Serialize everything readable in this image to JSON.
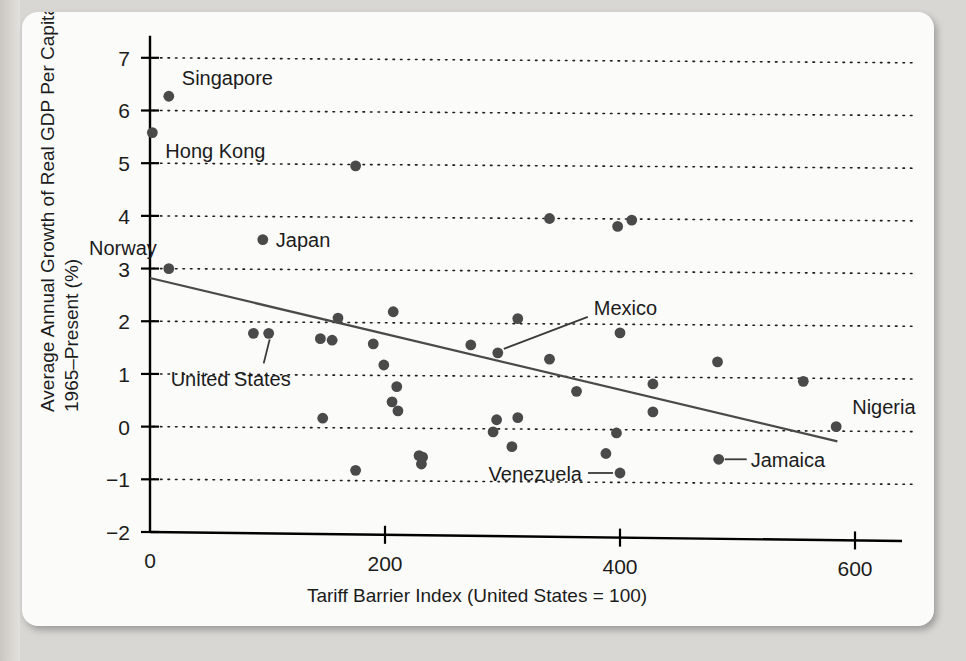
{
  "chart_data": {
    "type": "scatter",
    "title": "",
    "xlabel": "Tariff Barrier Index (United States = 100)",
    "ylabel": "Average Annual Growth of Real GDP Per Capita, 1965–Present (%)",
    "ylabel_line1": "Average Annual Growth of Real GDP Per Capita,",
    "ylabel_line2": "1965–Present (%)",
    "xlim": [
      0,
      640
    ],
    "ylim": [
      -2,
      7.3
    ],
    "xticks": [
      0,
      200,
      400,
      600
    ],
    "xtick_labels": [
      "0",
      "200",
      "400",
      "600"
    ],
    "yticks": [
      -2,
      -1,
      0,
      1,
      2,
      3,
      4,
      5,
      6,
      7
    ],
    "ytick_labels": [
      "-2",
      "-1",
      "0",
      "1",
      "2",
      "3",
      "4",
      "5",
      "6",
      "7"
    ],
    "grid": "horizontal-dotted",
    "legend": "none",
    "trendline": {
      "description": "downward sloping fitted line",
      "x_start": 0,
      "y_start": 2.82,
      "x_end": 585,
      "y_end": -0.28
    },
    "points": [
      {
        "x": 16,
        "y": 6.27,
        "label": "Singapore"
      },
      {
        "x": 2,
        "y": 5.58,
        "label": "Hong Kong"
      },
      {
        "x": 175,
        "y": 4.95,
        "label": ""
      },
      {
        "x": 340,
        "y": 3.95,
        "label": ""
      },
      {
        "x": 398,
        "y": 3.8,
        "label": ""
      },
      {
        "x": 410,
        "y": 3.92,
        "label": ""
      },
      {
        "x": 96,
        "y": 3.55,
        "label": "Japan"
      },
      {
        "x": 16,
        "y": 3.0,
        "label": "Norway"
      },
      {
        "x": 207,
        "y": 2.18,
        "label": ""
      },
      {
        "x": 160,
        "y": 2.06,
        "label": ""
      },
      {
        "x": 313,
        "y": 2.05,
        "label": ""
      },
      {
        "x": 88,
        "y": 1.77,
        "label": ""
      },
      {
        "x": 101,
        "y": 1.77,
        "label": "United States"
      },
      {
        "x": 400,
        "y": 1.78,
        "label": ""
      },
      {
        "x": 145,
        "y": 1.67,
        "label": ""
      },
      {
        "x": 155,
        "y": 1.64,
        "label": ""
      },
      {
        "x": 190,
        "y": 1.57,
        "label": ""
      },
      {
        "x": 273,
        "y": 1.55,
        "label": ""
      },
      {
        "x": 296,
        "y": 1.4,
        "label": "Mexico"
      },
      {
        "x": 340,
        "y": 1.28,
        "label": ""
      },
      {
        "x": 483,
        "y": 1.23,
        "label": ""
      },
      {
        "x": 199,
        "y": 1.17,
        "label": ""
      },
      {
        "x": 556,
        "y": 0.86,
        "label": ""
      },
      {
        "x": 428,
        "y": 0.81,
        "label": ""
      },
      {
        "x": 210,
        "y": 0.76,
        "label": ""
      },
      {
        "x": 363,
        "y": 0.67,
        "label": ""
      },
      {
        "x": 206,
        "y": 0.47,
        "label": ""
      },
      {
        "x": 211,
        "y": 0.3,
        "label": ""
      },
      {
        "x": 428,
        "y": 0.28,
        "label": ""
      },
      {
        "x": 147,
        "y": 0.16,
        "label": ""
      },
      {
        "x": 295,
        "y": 0.13,
        "label": ""
      },
      {
        "x": 313,
        "y": 0.17,
        "label": ""
      },
      {
        "x": 584,
        "y": 0.0,
        "label": "Nigeria"
      },
      {
        "x": 292,
        "y": -0.1,
        "label": ""
      },
      {
        "x": 397,
        "y": -0.12,
        "label": ""
      },
      {
        "x": 308,
        "y": -0.38,
        "label": ""
      },
      {
        "x": 388,
        "y": -0.51,
        "label": ""
      },
      {
        "x": 229,
        "y": -0.55,
        "label": ""
      },
      {
        "x": 232,
        "y": -0.58,
        "label": ""
      },
      {
        "x": 484,
        "y": -0.62,
        "label": "Jamaica"
      },
      {
        "x": 231,
        "y": -0.71,
        "label": ""
      },
      {
        "x": 175,
        "y": -0.83,
        "label": ""
      },
      {
        "x": 400,
        "y": -0.88,
        "label": "Venezuela"
      }
    ],
    "annotations": [
      {
        "text": "Singapore",
        "kind": "adjacent",
        "point_x": 16,
        "point_y": 6.27
      },
      {
        "text": "Hong Kong",
        "kind": "adjacent",
        "point_x": 2,
        "point_y": 5.58
      },
      {
        "text": "Japan",
        "kind": "adjacent",
        "point_x": 96,
        "point_y": 3.55
      },
      {
        "text": "Norway",
        "kind": "adjacent",
        "point_x": 16,
        "point_y": 3.0
      },
      {
        "text": "United States",
        "kind": "leader",
        "point_x": 101,
        "point_y": 1.77
      },
      {
        "text": "Mexico",
        "kind": "leader",
        "point_x": 296,
        "point_y": 1.4
      },
      {
        "text": "Nigeria",
        "kind": "adjacent",
        "point_x": 584,
        "point_y": 0.0
      },
      {
        "text": "Jamaica",
        "kind": "leader",
        "point_x": 484,
        "point_y": -0.62
      },
      {
        "text": "Venezuela",
        "kind": "leader",
        "point_x": 400,
        "point_y": -0.88
      }
    ]
  },
  "colors": {
    "dot": "#4a4a4a",
    "axis": "#000000",
    "trendline": "#4a4a4a",
    "card_background": "#fbfbfa",
    "page_background": "#d9d7d3"
  }
}
